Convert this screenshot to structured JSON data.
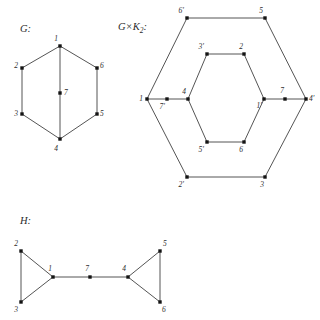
{
  "figure": {
    "background_color": "#ffffff",
    "edge_color": "#555555",
    "vertex_color": "#141414",
    "label_color": "#2e2e2e",
    "width": 320,
    "height": 320
  },
  "panels": {
    "g": {
      "caption": "G:",
      "caption_x": 20,
      "caption_y": 32,
      "vertices": [
        {
          "id": "1",
          "label": "1",
          "x": 60,
          "y": 46,
          "lx": 58,
          "ly": 41,
          "anchor": "end"
        },
        {
          "id": "2",
          "label": "2",
          "x": 22,
          "y": 68,
          "lx": 18,
          "ly": 68,
          "anchor": "end"
        },
        {
          "id": "3",
          "label": "3",
          "x": 22,
          "y": 114,
          "lx": 18,
          "ly": 116,
          "anchor": "end"
        },
        {
          "id": "4",
          "label": "4",
          "x": 60,
          "y": 139,
          "lx": 58,
          "ly": 151,
          "anchor": "end"
        },
        {
          "id": "5",
          "label": "5",
          "x": 97,
          "y": 114,
          "lx": 100,
          "ly": 116,
          "anchor": "start"
        },
        {
          "id": "6",
          "label": "6",
          "x": 97,
          "y": 68,
          "lx": 100,
          "ly": 68,
          "anchor": "start"
        },
        {
          "id": "7",
          "label": "7",
          "x": 60,
          "y": 93,
          "lx": 64,
          "ly": 95,
          "anchor": "start"
        }
      ],
      "edges": [
        [
          "1",
          "2"
        ],
        [
          "2",
          "3"
        ],
        [
          "3",
          "4"
        ],
        [
          "4",
          "5"
        ],
        [
          "5",
          "6"
        ],
        [
          "6",
          "1"
        ],
        [
          "1",
          "7"
        ],
        [
          "7",
          "4"
        ]
      ]
    },
    "gk2": {
      "caption_main": "G×K",
      "caption_sub": "2",
      "caption_tail": ":",
      "caption_x": 118,
      "caption_y": 30,
      "vertices": [
        {
          "id": "6p",
          "label": "6′",
          "x": 187,
          "y": 18,
          "lx": 184,
          "ly": 13,
          "anchor": "end"
        },
        {
          "id": "5",
          "label": "5",
          "x": 265,
          "y": 18,
          "lx": 263,
          "ly": 13,
          "anchor": "end"
        },
        {
          "id": "4p",
          "label": "4′",
          "x": 306,
          "y": 99,
          "lx": 309,
          "ly": 101,
          "anchor": "start"
        },
        {
          "id": "3",
          "label": "3",
          "x": 265,
          "y": 177,
          "lx": 264,
          "ly": 187,
          "anchor": "end"
        },
        {
          "id": "2p",
          "label": "2′",
          "x": 187,
          "y": 177,
          "lx": 184,
          "ly": 187,
          "anchor": "end"
        },
        {
          "id": "1",
          "label": "1",
          "x": 147,
          "y": 99,
          "lx": 143,
          "ly": 101,
          "anchor": "end"
        },
        {
          "id": "3p",
          "label": "3′",
          "x": 207,
          "y": 54,
          "lx": 204,
          "ly": 49,
          "anchor": "end"
        },
        {
          "id": "2",
          "label": "2",
          "x": 244,
          "y": 54,
          "lx": 243,
          "ly": 49,
          "anchor": "end"
        },
        {
          "id": "1p",
          "label": "1′",
          "x": 264,
          "y": 99,
          "lx": 262,
          "ly": 108,
          "anchor": "end"
        },
        {
          "id": "6",
          "label": "6",
          "x": 244,
          "y": 142,
          "lx": 243,
          "ly": 152,
          "anchor": "end"
        },
        {
          "id": "5p",
          "label": "5′",
          "x": 207,
          "y": 142,
          "lx": 204,
          "ly": 152,
          "anchor": "end"
        },
        {
          "id": "4",
          "label": "4",
          "x": 188,
          "y": 99,
          "lx": 186,
          "ly": 94,
          "anchor": "end"
        },
        {
          "id": "7p",
          "label": "7′",
          "x": 167,
          "y": 99,
          "lx": 165,
          "ly": 109,
          "anchor": "end"
        },
        {
          "id": "7",
          "label": "7",
          "x": 285,
          "y": 99,
          "lx": 284,
          "ly": 93,
          "anchor": "end"
        }
      ],
      "edges": [
        [
          "6p",
          "5"
        ],
        [
          "5",
          "4p"
        ],
        [
          "4p",
          "3"
        ],
        [
          "3",
          "2p"
        ],
        [
          "2p",
          "1"
        ],
        [
          "1",
          "6p"
        ],
        [
          "3p",
          "2"
        ],
        [
          "2",
          "1p"
        ],
        [
          "1p",
          "6"
        ],
        [
          "6",
          "5p"
        ],
        [
          "5p",
          "4"
        ],
        [
          "4",
          "3p"
        ],
        [
          "1",
          "7p"
        ],
        [
          "7p",
          "4"
        ],
        [
          "1p",
          "7"
        ],
        [
          "7",
          "4p"
        ]
      ]
    },
    "h": {
      "caption": "H:",
      "caption_x": 20,
      "caption_y": 224,
      "vertices": [
        {
          "id": "2",
          "label": "2",
          "x": 21,
          "y": 251,
          "lx": 18,
          "ly": 246,
          "anchor": "end"
        },
        {
          "id": "3",
          "label": "3",
          "x": 21,
          "y": 302,
          "lx": 18,
          "ly": 312,
          "anchor": "end"
        },
        {
          "id": "1",
          "label": "1",
          "x": 53,
          "y": 277,
          "lx": 52,
          "ly": 271,
          "anchor": "end"
        },
        {
          "id": "7",
          "label": "7",
          "x": 90,
          "y": 277,
          "lx": 89,
          "ly": 271,
          "anchor": "end"
        },
        {
          "id": "4",
          "label": "4",
          "x": 128,
          "y": 277,
          "lx": 126,
          "ly": 271,
          "anchor": "end"
        },
        {
          "id": "5",
          "label": "5",
          "x": 160,
          "y": 251,
          "lx": 163,
          "ly": 246,
          "anchor": "start"
        },
        {
          "id": "6",
          "label": "6",
          "x": 160,
          "y": 302,
          "lx": 162,
          "ly": 312,
          "anchor": "start"
        }
      ],
      "edges": [
        [
          "2",
          "3"
        ],
        [
          "2",
          "1"
        ],
        [
          "3",
          "1"
        ],
        [
          "1",
          "7"
        ],
        [
          "7",
          "4"
        ],
        [
          "4",
          "5"
        ],
        [
          "4",
          "6"
        ],
        [
          "5",
          "6"
        ]
      ]
    }
  }
}
